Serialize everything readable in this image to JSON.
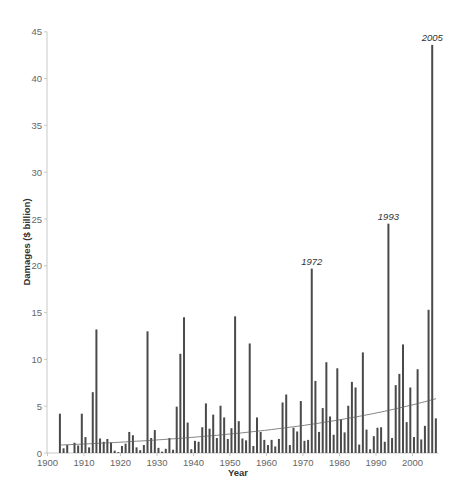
{
  "chart_data": {
    "type": "bar",
    "title": "",
    "xlabel": "Year",
    "ylabel": "Damages ($ billion)",
    "xlim": [
      1900,
      2007
    ],
    "ylim": [
      0,
      45
    ],
    "x_ticks": [
      1900,
      1910,
      1920,
      1930,
      1940,
      1950,
      1960,
      1970,
      1980,
      1990,
      2000
    ],
    "y_ticks": [
      0,
      5,
      10,
      15,
      20,
      25,
      30,
      35,
      40,
      45
    ],
    "grid": false,
    "legend": null,
    "bar_color": "#4a4a4a",
    "trend_line": {
      "type": "exponential",
      "color": "#666666",
      "start": {
        "x": 1903,
        "y": 0.85
      },
      "end": {
        "x": 2006,
        "y": 5.8
      }
    },
    "annotations": [
      {
        "x": 1972,
        "y": 19.7,
        "text": "1972"
      },
      {
        "x": 1993,
        "y": 24.5,
        "text": "1993"
      },
      {
        "x": 2005,
        "y": 43.6,
        "text": "2005"
      }
    ],
    "x": [
      1903,
      1904,
      1905,
      1907,
      1908,
      1909,
      1910,
      1911,
      1912,
      1913,
      1914,
      1915,
      1916,
      1917,
      1918,
      1919,
      1920,
      1921,
      1922,
      1923,
      1924,
      1925,
      1926,
      1927,
      1928,
      1929,
      1930,
      1931,
      1932,
      1933,
      1934,
      1935,
      1936,
      1937,
      1938,
      1939,
      1940,
      1941,
      1942,
      1943,
      1944,
      1945,
      1946,
      1947,
      1948,
      1949,
      1950,
      1951,
      1952,
      1953,
      1954,
      1955,
      1956,
      1957,
      1958,
      1959,
      1960,
      1961,
      1962,
      1963,
      1964,
      1965,
      1966,
      1967,
      1968,
      1969,
      1970,
      1971,
      1972,
      1973,
      1974,
      1975,
      1976,
      1977,
      1978,
      1979,
      1980,
      1981,
      1982,
      1983,
      1984,
      1985,
      1986,
      1987,
      1988,
      1989,
      1990,
      1991,
      1992,
      1993,
      1994,
      1995,
      1996,
      1997,
      1998,
      1999,
      2000,
      2001,
      2002,
      2003,
      2004,
      2005,
      2006
    ],
    "values": [
      4.2,
      0.5,
      0.85,
      1.1,
      0.8,
      4.2,
      1.7,
      0.6,
      6.5,
      13.2,
      1.55,
      1.2,
      1.5,
      1.1,
      0.25,
      0.1,
      0.75,
      1.0,
      2.25,
      1.9,
      0.6,
      0.3,
      0.85,
      13.0,
      1.6,
      2.45,
      0.55,
      0.15,
      0.45,
      1.6,
      0.35,
      4.95,
      10.6,
      14.5,
      3.25,
      0.4,
      1.3,
      1.2,
      2.75,
      5.3,
      2.6,
      4.1,
      1.6,
      5.05,
      3.8,
      1.5,
      2.65,
      14.6,
      3.4,
      1.55,
      1.35,
      11.7,
      0.75,
      3.8,
      2.25,
      1.4,
      0.85,
      1.4,
      0.7,
      1.5,
      5.4,
      6.25,
      0.85,
      2.7,
      2.3,
      5.55,
      1.3,
      1.4,
      19.7,
      7.7,
      2.25,
      4.8,
      9.7,
      3.9,
      1.95,
      9.05,
      3.6,
      2.2,
      5.05,
      7.6,
      7.0,
      0.9,
      10.75,
      2.5,
      0.4,
      1.8,
      2.7,
      2.75,
      1.2,
      24.5,
      1.6,
      7.25,
      8.45,
      11.6,
      3.3,
      7.0,
      1.7,
      8.95,
      1.45,
      2.9,
      15.3,
      43.6,
      3.7
    ]
  }
}
